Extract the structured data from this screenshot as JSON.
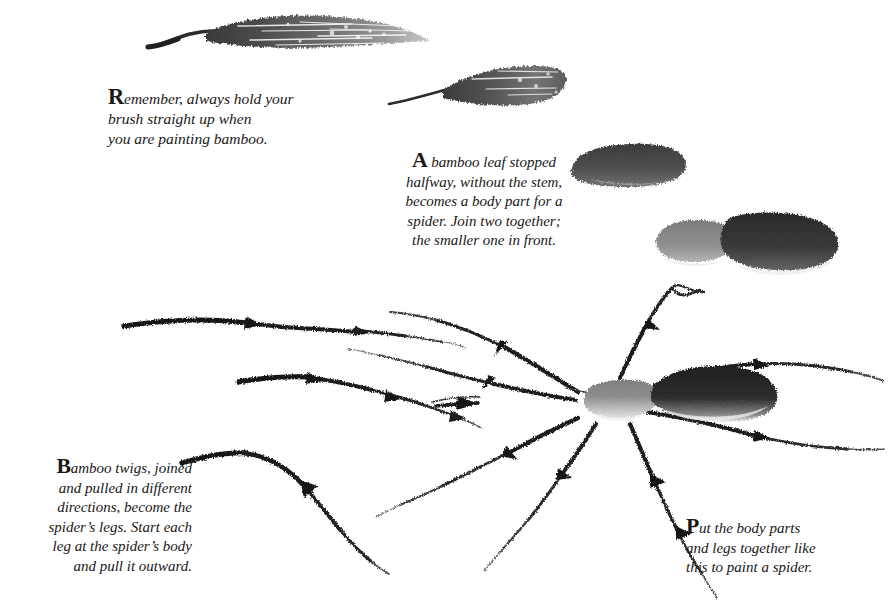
{
  "page": {
    "background_color": "#ffffff",
    "ink_color": "#1a1716"
  },
  "captions": {
    "remember": {
      "dropcap": "R",
      "lines": [
        "emember, always hold your",
        "brush straight up when",
        "you are painting bamboo."
      ],
      "full_text": "Remember, always hold your brush straight up when you are painting bamboo."
    },
    "bamboo_leaf": {
      "dropcap": "A",
      "lines": [
        "bamboo leaf stopped",
        "halfway, without the stem,",
        "becomes a body part for a",
        "spider. Join two together;",
        "the smaller one in front."
      ],
      "full_text": "A bamboo leaf stopped halfway, without the stem, becomes a body part for a spider. Join two together; the smaller one in front."
    },
    "twigs": {
      "dropcap": "B",
      "lines": [
        "amboo twigs, joined",
        "and pulled in different",
        "directions, become the",
        "spider’s legs. Start each",
        "leg at the spider’s body",
        "and pull it outward."
      ],
      "full_text": "Bamboo twigs, joined and pulled in different directions, become the spider’s legs. Start each leg at the spider’s body and pull it outward."
    },
    "put_together": {
      "dropcap": "P",
      "lines": [
        "ut the body parts",
        "and legs together like",
        "this to paint a spider."
      ],
      "full_text": "Put the body parts and legs together like this to paint a spider."
    }
  },
  "artwork": {
    "strokes": [
      {
        "name": "long-bamboo-leaf",
        "label": "Long bamboo leaf with stem, tapering to a point"
      },
      {
        "name": "half-bamboo-leaf",
        "label": "Bamboo leaf stopped halfway, blunt end"
      },
      {
        "name": "body-part-blob",
        "label": "Single body part blob"
      },
      {
        "name": "joined-body-parts",
        "label": "Two body parts joined, smaller lighter one in front"
      },
      {
        "name": "bamboo-twig-straight",
        "label": "Segmented bamboo twig, nearly horizontal"
      },
      {
        "name": "bamboo-twig-sloping",
        "label": "Segmented bamboo twig sloping downward"
      },
      {
        "name": "bamboo-twig-curved",
        "label": "Curved bamboo twig arcing down to the right"
      },
      {
        "name": "finished-spider",
        "label": "Finished spider with two body blobs and eight jointed legs"
      }
    ],
    "spider": {
      "cephalothorax_color": "#8d8d8d",
      "abdomen_color": "#262626",
      "leg_count": 8
    }
  }
}
